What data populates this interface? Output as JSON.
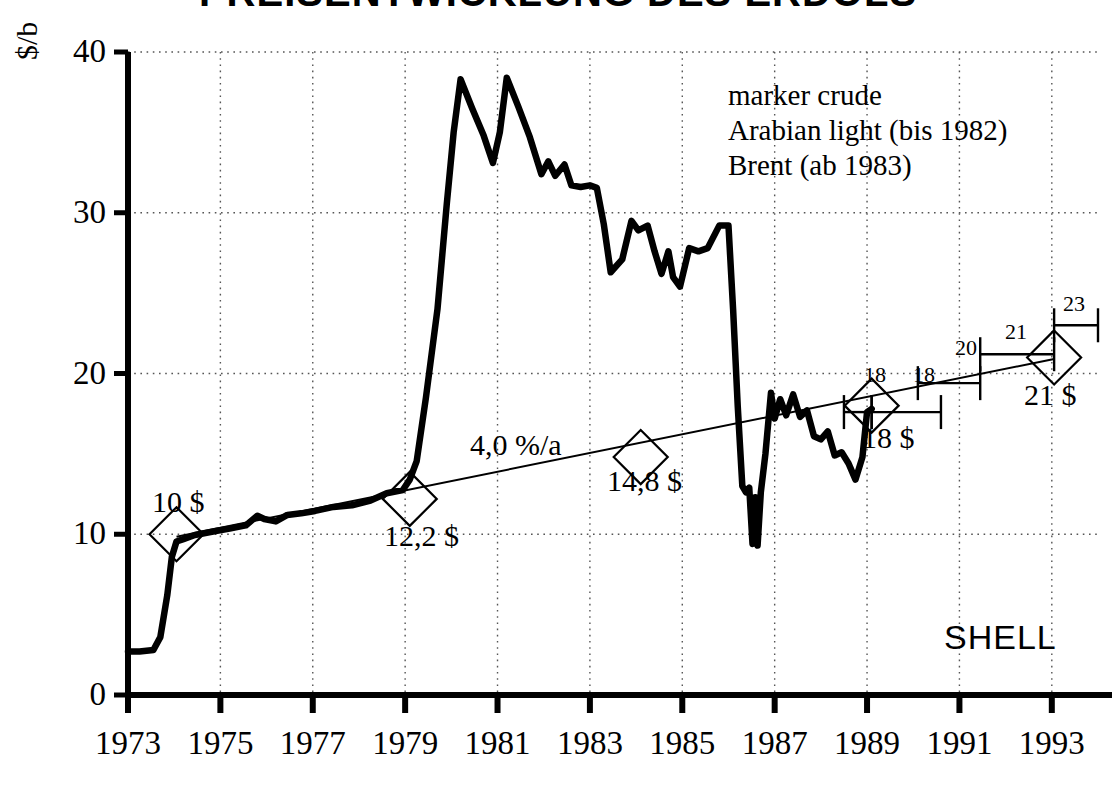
{
  "title": "PREISENTWICKLUNG DES ERDÖLS",
  "brand": "SHELL",
  "legend": {
    "line1": "marker  crude",
    "line2": "Arabian light (bis 1982)",
    "line3": "Brent (ab 1983)"
  },
  "annotations": {
    "growth_rate": "4,0  %/a",
    "p1974": "10 $",
    "p1979": "12,2 $",
    "p1984": "14,8 $",
    "p1989": "18 $",
    "p1993": "21 $",
    "range_1989_low": "18",
    "range_1989_high": "18",
    "range_1991": "20",
    "range_1992": "21",
    "range_1993": "23"
  },
  "chart_data": {
    "type": "line",
    "title": "PREISENTWICKLUNG DES ERDÖLS",
    "xlabel": "",
    "ylabel": "$/b",
    "xlim": [
      1973,
      1994
    ],
    "ylim": [
      0,
      40
    ],
    "grid": true,
    "legend_position": "top-right",
    "xticks": [
      "1973",
      "1975",
      "1977",
      "1979",
      "1981",
      "1983",
      "1985",
      "1987",
      "1989",
      "1991",
      "1993"
    ],
    "yticks": [
      "0",
      "10",
      "20",
      "30",
      "40"
    ],
    "series": [
      {
        "name": "marker crude (Arabian light / Brent)",
        "style": "thick-black-line",
        "points": [
          [
            1973.0,
            2.7
          ],
          [
            1973.25,
            2.7
          ],
          [
            1973.55,
            2.8
          ],
          [
            1973.7,
            3.6
          ],
          [
            1973.85,
            6.2
          ],
          [
            1973.95,
            8.6
          ],
          [
            1974.05,
            9.55
          ],
          [
            1974.2,
            9.7
          ],
          [
            1974.45,
            9.95
          ],
          [
            1974.9,
            10.2
          ],
          [
            1975.2,
            10.35
          ],
          [
            1975.55,
            10.55
          ],
          [
            1975.8,
            11.15
          ],
          [
            1975.95,
            10.95
          ],
          [
            1976.2,
            10.8
          ],
          [
            1976.45,
            11.2
          ],
          [
            1976.75,
            11.3
          ],
          [
            1977.05,
            11.45
          ],
          [
            1977.45,
            11.7
          ],
          [
            1977.85,
            11.8
          ],
          [
            1978.25,
            12.1
          ],
          [
            1978.6,
            12.55
          ],
          [
            1978.95,
            12.75
          ],
          [
            1979.1,
            13.4
          ],
          [
            1979.25,
            14.55
          ],
          [
            1979.45,
            18.5
          ],
          [
            1979.7,
            24.0
          ],
          [
            1979.9,
            30.5
          ],
          [
            1980.05,
            35.0
          ],
          [
            1980.2,
            38.3
          ],
          [
            1980.45,
            36.5
          ],
          [
            1980.7,
            34.8
          ],
          [
            1980.9,
            33.1
          ],
          [
            1981.05,
            35.0
          ],
          [
            1981.2,
            38.4
          ],
          [
            1981.45,
            36.6
          ],
          [
            1981.7,
            34.7
          ],
          [
            1981.95,
            32.4
          ],
          [
            1982.1,
            33.2
          ],
          [
            1982.25,
            32.3
          ],
          [
            1982.45,
            33.0
          ],
          [
            1982.6,
            31.7
          ],
          [
            1982.8,
            31.6
          ],
          [
            1983.0,
            31.7
          ],
          [
            1983.15,
            31.55
          ],
          [
            1983.3,
            29.3
          ],
          [
            1983.45,
            26.3
          ],
          [
            1983.7,
            27.1
          ],
          [
            1983.9,
            29.5
          ],
          [
            1984.05,
            28.9
          ],
          [
            1984.25,
            29.2
          ],
          [
            1984.4,
            27.6
          ],
          [
            1984.55,
            26.2
          ],
          [
            1984.7,
            27.6
          ],
          [
            1984.8,
            26.0
          ],
          [
            1984.95,
            25.4
          ],
          [
            1985.15,
            27.8
          ],
          [
            1985.35,
            27.6
          ],
          [
            1985.55,
            27.8
          ],
          [
            1985.8,
            29.2
          ],
          [
            1986.0,
            29.2
          ],
          [
            1986.1,
            24.0
          ],
          [
            1986.2,
            18.0
          ],
          [
            1986.3,
            13.0
          ],
          [
            1986.38,
            12.6
          ],
          [
            1986.45,
            12.9
          ],
          [
            1986.52,
            9.4
          ],
          [
            1986.58,
            12.3
          ],
          [
            1986.63,
            9.3
          ],
          [
            1986.7,
            12.6
          ],
          [
            1986.8,
            15.0
          ],
          [
            1986.92,
            18.8
          ],
          [
            1987.0,
            17.2
          ],
          [
            1987.12,
            18.4
          ],
          [
            1987.25,
            17.4
          ],
          [
            1987.4,
            18.7
          ],
          [
            1987.55,
            17.3
          ],
          [
            1987.7,
            17.7
          ],
          [
            1987.85,
            16.1
          ],
          [
            1988.0,
            15.9
          ],
          [
            1988.15,
            16.4
          ],
          [
            1988.3,
            14.9
          ],
          [
            1988.45,
            15.1
          ],
          [
            1988.6,
            14.4
          ],
          [
            1988.75,
            13.4
          ],
          [
            1988.9,
            14.8
          ],
          [
            1989.0,
            17.6
          ],
          [
            1989.1,
            17.8
          ]
        ]
      },
      {
        "name": "Trendlinie 4,0 %/a",
        "style": "thin-black-line",
        "points": [
          [
            1974.05,
            9.85
          ],
          [
            1993.05,
            20.9
          ]
        ]
      }
    ],
    "markers": [
      {
        "year": 1974.05,
        "value": 10.0,
        "label": "10 $",
        "label_pos": "above-left"
      },
      {
        "year": 1979.1,
        "value": 12.2,
        "label": "12,2 $",
        "label_pos": "below"
      },
      {
        "year": 1984.1,
        "value": 14.8,
        "label": "14,8 $",
        "label_pos": "below"
      },
      {
        "year": 1989.1,
        "value": 18.0,
        "label": "18 $",
        "label_pos": "below"
      },
      {
        "year": 1993.05,
        "value": 21.0,
        "label": "21 $",
        "label_pos": "below"
      }
    ],
    "range_bars": [
      {
        "label": "18",
        "year_from": 1988.5,
        "year_to": 1989.1,
        "value": 17.6
      },
      {
        "label": "18",
        "year_from": 1989.1,
        "year_to": 1990.6,
        "value": 17.6
      },
      {
        "label": "20",
        "year_from": 1990.1,
        "year_to": 1991.45,
        "value": 19.4
      },
      {
        "label": "21",
        "year_from": 1991.45,
        "year_to": 1993.05,
        "value": 21.2
      },
      {
        "label": "23",
        "year_from": 1993.05,
        "year_to": 1994.0,
        "value": 23.0
      }
    ]
  }
}
